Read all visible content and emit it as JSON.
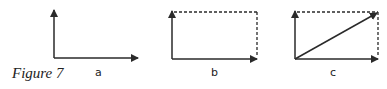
{
  "caption": "Figure 7",
  "panels": [
    {
      "label": "a",
      "dashed_completion": false,
      "diagonal": false
    },
    {
      "label": "b",
      "dashed_completion": true,
      "diagonal": false
    },
    {
      "label": "c",
      "dashed_completion": true,
      "diagonal": true
    }
  ],
  "colors": {
    "stroke": "#2a2a2a",
    "background": "#ffffff"
  }
}
